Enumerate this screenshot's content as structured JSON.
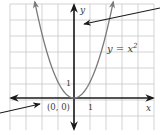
{
  "diagram": {
    "type": "coordinate-graph",
    "equation_label": "y = x",
    "equation_exponent": "2",
    "equation_full": "y = x^2",
    "axes": {
      "x_label": "x",
      "y_label": "y",
      "x_tick_label": "1",
      "y_tick_label": "1"
    },
    "vertex_label": "(0, 0)",
    "grid": {
      "left": 10,
      "right": 154,
      "top": 4,
      "bottom": 130,
      "spacing": 16,
      "origin_px": [
        74,
        98
      ],
      "unit_px": 16
    },
    "callouts": [
      {
        "name": "y-axis-callout",
        "from": [
          160,
          8
        ],
        "to": [
          84,
          24
        ]
      },
      {
        "name": "vertex-callout",
        "from": [
          0,
          113
        ],
        "to": [
          40,
          104
        ]
      }
    ],
    "colors": {
      "grid": "#c8c8c8",
      "axis": "#1a1a1a",
      "curve": "#7a7a7a",
      "text": "#3a3a3a",
      "callout": "#1a1a1a"
    }
  }
}
